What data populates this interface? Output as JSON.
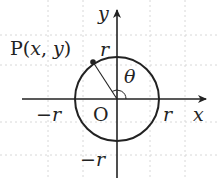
{
  "diagram": {
    "type": "unit-circle-angle",
    "labels": {
      "point": "P(x, y)",
      "point_prefix": "P(",
      "point_x": "x",
      "point_sep": ", ",
      "point_y": "y",
      "point_suffix": ")",
      "origin": "O",
      "angle": "θ",
      "x_axis": "x",
      "y_axis": "y",
      "r_pos_x": "r",
      "r_neg_x": "−r",
      "r_pos_y": "r",
      "r_neg_y": "−r"
    },
    "colors": {
      "stroke": "#222222",
      "grid": "#d8d8d8",
      "background": "#ffffff"
    }
  }
}
